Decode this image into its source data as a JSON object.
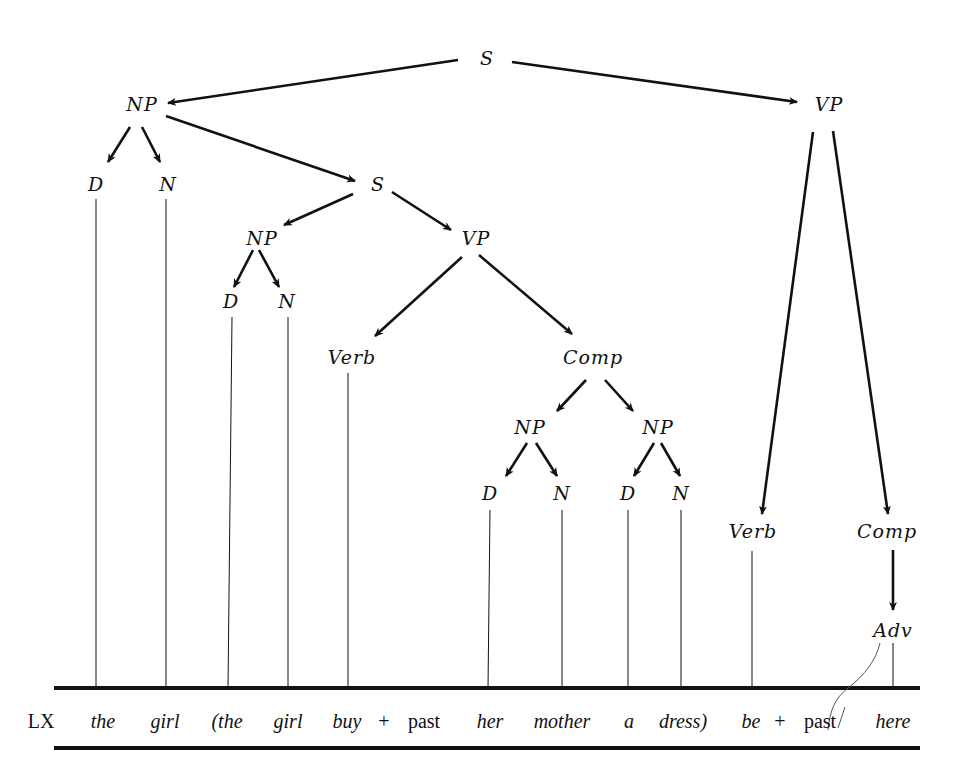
{
  "diagram": {
    "type": "phrase-structure-tree",
    "colors": {
      "ink": "#111111",
      "background": "#ffffff",
      "annotation": "#555555"
    },
    "nodes": [
      {
        "id": "s0",
        "label": "S",
        "x": 487,
        "y": 58
      },
      {
        "id": "np1",
        "label": "NP",
        "x": 142,
        "y": 104
      },
      {
        "id": "vp1",
        "label": "VP",
        "x": 829,
        "y": 104
      },
      {
        "id": "d1",
        "label": "D",
        "x": 96,
        "y": 184
      },
      {
        "id": "n1",
        "label": "N",
        "x": 168,
        "y": 184
      },
      {
        "id": "s1",
        "label": "S",
        "x": 378,
        "y": 184
      },
      {
        "id": "np2",
        "label": "NP",
        "x": 262,
        "y": 238
      },
      {
        "id": "vp2",
        "label": "VP",
        "x": 476,
        "y": 238
      },
      {
        "id": "d2",
        "label": "D",
        "x": 231,
        "y": 301
      },
      {
        "id": "n2",
        "label": "N",
        "x": 287,
        "y": 301
      },
      {
        "id": "verb1",
        "label": "Verb",
        "x": 352,
        "y": 357
      },
      {
        "id": "comp1",
        "label": "Comp",
        "x": 593,
        "y": 357
      },
      {
        "id": "np3",
        "label": "NP",
        "x": 530,
        "y": 427
      },
      {
        "id": "np4",
        "label": "NP",
        "x": 658,
        "y": 427
      },
      {
        "id": "d3",
        "label": "D",
        "x": 490,
        "y": 493
      },
      {
        "id": "n3",
        "label": "N",
        "x": 562,
        "y": 493
      },
      {
        "id": "d4",
        "label": "D",
        "x": 628,
        "y": 493
      },
      {
        "id": "n4",
        "label": "N",
        "x": 681,
        "y": 493
      },
      {
        "id": "verb2",
        "label": "Verb",
        "x": 753,
        "y": 531
      },
      {
        "id": "comp2",
        "label": "Comp",
        "x": 887,
        "y": 531
      },
      {
        "id": "adv",
        "label": "Adv",
        "x": 893,
        "y": 630
      }
    ],
    "arrows": [
      {
        "from": "s0",
        "to": "np1",
        "x1": 458,
        "y1": 60,
        "x2": 168,
        "y2": 103
      },
      {
        "from": "s0",
        "to": "vp1",
        "x1": 512,
        "y1": 62,
        "x2": 797,
        "y2": 102
      },
      {
        "from": "np1",
        "to": "d1",
        "x1": 130,
        "y1": 127,
        "x2": 108,
        "y2": 162
      },
      {
        "from": "np1",
        "to": "n1",
        "x1": 142,
        "y1": 127,
        "x2": 160,
        "y2": 162
      },
      {
        "from": "np1",
        "to": "s1",
        "x1": 166,
        "y1": 116,
        "x2": 355,
        "y2": 181
      },
      {
        "from": "s1",
        "to": "np2",
        "x1": 353,
        "y1": 194,
        "x2": 284,
        "y2": 225
      },
      {
        "from": "s1",
        "to": "vp2",
        "x1": 392,
        "y1": 192,
        "x2": 451,
        "y2": 230
      },
      {
        "from": "np2",
        "to": "d2",
        "x1": 253,
        "y1": 250,
        "x2": 234,
        "y2": 287
      },
      {
        "from": "np2",
        "to": "n2",
        "x1": 259,
        "y1": 250,
        "x2": 279,
        "y2": 287
      },
      {
        "from": "vp2",
        "to": "verb1",
        "x1": 462,
        "y1": 257,
        "x2": 375,
        "y2": 336
      },
      {
        "from": "vp2",
        "to": "comp1",
        "x1": 479,
        "y1": 255,
        "x2": 572,
        "y2": 334
      },
      {
        "from": "comp1",
        "to": "np3",
        "x1": 586,
        "y1": 380,
        "x2": 557,
        "y2": 411
      },
      {
        "from": "comp1",
        "to": "np4",
        "x1": 605,
        "y1": 380,
        "x2": 633,
        "y2": 411
      },
      {
        "from": "np3",
        "to": "d3",
        "x1": 527,
        "y1": 443,
        "x2": 506,
        "y2": 476
      },
      {
        "from": "np3",
        "to": "n3",
        "x1": 536,
        "y1": 443,
        "x2": 557,
        "y2": 476
      },
      {
        "from": "np4",
        "to": "d4",
        "x1": 654,
        "y1": 443,
        "x2": 634,
        "y2": 476
      },
      {
        "from": "np4",
        "to": "n4",
        "x1": 661,
        "y1": 443,
        "x2": 680,
        "y2": 476
      },
      {
        "from": "vp1",
        "to": "verb2",
        "x1": 813,
        "y1": 132,
        "x2": 762,
        "y2": 514
      },
      {
        "from": "vp1",
        "to": "comp2",
        "x1": 833,
        "y1": 131,
        "x2": 888,
        "y2": 514
      },
      {
        "from": "comp2",
        "to": "adv",
        "x1": 893,
        "y1": 550,
        "x2": 893,
        "y2": 610
      }
    ],
    "terminal_lines": [
      {
        "x": 96,
        "y1": 199,
        "y2": 688
      },
      {
        "x": 166,
        "y1": 199,
        "y2": 688
      },
      {
        "x": 232,
        "y1": 317,
        "x2": 228,
        "y2": 688
      },
      {
        "x": 288,
        "y1": 317,
        "y2": 688
      },
      {
        "x": 348,
        "y1": 373,
        "y2": 688
      },
      {
        "x": 490,
        "y1": 510,
        "x2": 488,
        "y2": 688
      },
      {
        "x": 562,
        "y1": 510,
        "y2": 688
      },
      {
        "x": 628,
        "y1": 510,
        "y2": 688
      },
      {
        "x": 681,
        "y1": 510,
        "y2": 688
      },
      {
        "x": 752,
        "y1": 551,
        "y2": 688
      },
      {
        "x": 893,
        "y1": 643,
        "y2": 688
      }
    ],
    "rules": [
      {
        "x1": 54,
        "x2": 920,
        "y": 688,
        "thickness": 4
      },
      {
        "x1": 54,
        "x2": 920,
        "y": 748,
        "thickness": 4
      }
    ],
    "lexical_row": {
      "label": "LX",
      "label_x": 41,
      "y": 721,
      "items": [
        {
          "text": "the",
          "x": 103,
          "italic": true
        },
        {
          "text": "girl",
          "x": 165,
          "italic": true
        },
        {
          "text": "(the",
          "x": 227,
          "italic": true
        },
        {
          "text": "girl",
          "x": 288,
          "italic": true
        },
        {
          "text": "buy",
          "x": 347,
          "italic": true
        },
        {
          "text": "+",
          "x": 384,
          "italic": false
        },
        {
          "text": "past",
          "x": 424,
          "italic": false
        },
        {
          "text": "her",
          "x": 490,
          "italic": true
        },
        {
          "text": "mother",
          "x": 562,
          "italic": true
        },
        {
          "text": "a",
          "x": 629,
          "italic": true
        },
        {
          "text": "dress)",
          "x": 683,
          "italic": true
        },
        {
          "text": "be",
          "x": 751,
          "italic": true
        },
        {
          "text": "+",
          "x": 780,
          "italic": false
        },
        {
          "text": "past",
          "x": 820,
          "italic": false
        },
        {
          "text": "here",
          "x": 893,
          "italic": true
        }
      ]
    },
    "annotation_stroke": {
      "description": "faint hand-drawn curve from Adv toward past",
      "path": "M 880 643 C 876 660, 865 675, 848 688 C 835 698, 830 710, 828 730 M 845 707 L 838 728"
    }
  }
}
